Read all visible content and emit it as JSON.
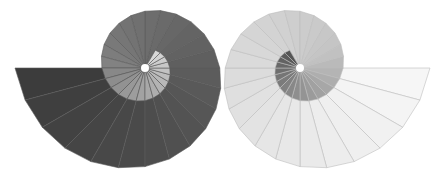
{
  "figure": {
    "width": 442,
    "height": 177
  },
  "spirals": [
    {
      "name": "left-spiral",
      "cx": 145,
      "cy": 68,
      "start_angle_deg": 180,
      "direction": -1,
      "start_radius": 130,
      "decay_per_step": 0.955,
      "steps": 40,
      "step_deg": 15,
      "shade_outer": "#3c3c3c",
      "shade_mid": "#7a7a7a",
      "shade_inner": "#d8d8d8",
      "stroke": "#5a5a5a"
    },
    {
      "name": "right-spiral",
      "cx": 300,
      "cy": 68,
      "start_angle_deg": 0,
      "direction": 1,
      "start_radius": 130,
      "decay_per_step": 0.955,
      "steps": 40,
      "step_deg": 15,
      "shade_outer": "#f6f6f6",
      "shade_mid": "#c4c4c4",
      "shade_inner": "#555555",
      "stroke": "#bdbdbd"
    }
  ]
}
